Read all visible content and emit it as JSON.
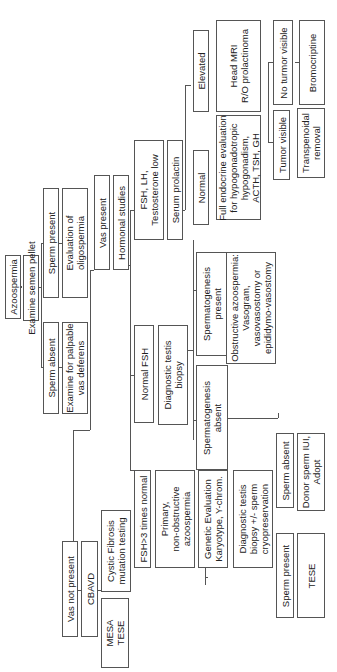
{
  "nodes": {
    "azoospermia": "Azoospermia",
    "examine_semen_pellet": "Examine semen pellet",
    "sperm_present": "Sperm present",
    "evaluation_oligospermia": "Evaluation of\noligospermia",
    "sperm_absent": "Sperm absent",
    "examine_vas": "Examine for palpable\nvas deferens",
    "vas_present": "Vas present",
    "hormonal_studies": "Hormonal studies",
    "fsh_lh_low": "FSH, LH,\nTestosterone low",
    "serum_prolactin": "Serum prolactin",
    "normal_prolactin": "Normal",
    "full_endocrine": "Full endocrine evaluation\nfor hypogonadotropic\nhypogonadism,\nACTH, TSH, GH",
    "elevated": "Elevated",
    "head_mri": "Head MRI\nR/O prolactinoma",
    "tumor_visible": "Tumor visible",
    "transphenoidal": "Transpenoidal\nremoval",
    "no_tumor_visible": "No turmor visible",
    "bromocriptine": "Bromocriptine",
    "normal_fsh": "Normal FSH",
    "diagnostic_biopsy": "Diagnostic testis\nbiopsy",
    "spermatogenesis_present": "Spermatogenesis\npresent",
    "obstructive": "Obstructive azoospermia:\nVasogram,\nvasovasostomy or\nepididymo-vasostomy",
    "spermatogenesis_absent": "Spermatogenesis\nabsent",
    "sperm_absent_2": "Sperm absent",
    "donor_sperm": "Donor sperm IUI,\nAdopt",
    "fsh_3x": "FSH>3 times normal",
    "primary_nonobstructive": "Primary,\nnon-obstructive\nazoospermia",
    "genetic_evaluation": "Genetic Evaluation\nKaryotype, Y-chrom.",
    "diagnostic_biopsy_cryo": "Diagnostic testis\nbiopsy +/- sperm\ncryopreservation",
    "sperm_present_2": "Sperm present",
    "tese": "TESE",
    "vas_not_present": "Vas not present",
    "cbavd": "CBAVD",
    "cystic_fibrosis": "Cystic Fibrosis\nmutation testing",
    "mesa_tese": "MESA\nTESE"
  }
}
